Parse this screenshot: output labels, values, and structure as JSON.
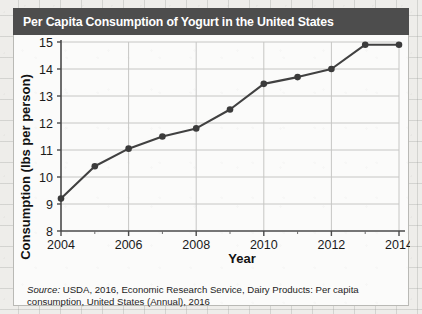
{
  "figure": {
    "title": "Per Capita Consumption of Yogurt in the United States",
    "title_bar_color": "#4d4d4d",
    "panel_color": "#fbfbfa",
    "source_prefix": "Source:",
    "source_text": " USDA, 2016, Economic Research Service, Dairy Products: Per capita consumption, United States (Annual), 2016"
  },
  "chart_data": {
    "type": "line",
    "title": "Per Capita Consumption of Yogurt in the United States",
    "xlabel": "Year",
    "ylabel": "Consumption (lbs per person)",
    "x": [
      2004,
      2005,
      2006,
      2007,
      2008,
      2009,
      2010,
      2011,
      2012,
      2013,
      2014
    ],
    "values": [
      9.2,
      10.4,
      11.05,
      11.5,
      11.8,
      12.5,
      13.45,
      13.7,
      14.0,
      14.9,
      14.9
    ],
    "xlim": [
      2004,
      2014
    ],
    "ylim": [
      8,
      15
    ],
    "xticks": [
      2004,
      2006,
      2008,
      2010,
      2012,
      2014
    ],
    "xticks_minor": [
      2005,
      2007,
      2009,
      2011,
      2013
    ],
    "yticks": [
      8,
      9,
      10,
      11,
      12,
      13,
      14,
      15
    ],
    "xtick_labels": [
      "2004",
      "2006",
      "2008",
      "2010",
      "2012",
      "2014"
    ],
    "ytick_labels": [
      "8",
      "9",
      "10",
      "11",
      "12",
      "13",
      "14",
      "15"
    ],
    "grid": true,
    "grid_axis": "both",
    "legend": false,
    "line_color": "#414141",
    "marker": "circle",
    "marker_color": "#3b3b3b"
  }
}
